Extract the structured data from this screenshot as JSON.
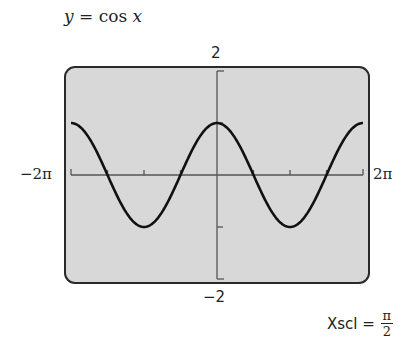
{
  "title": {
    "lhs": "y",
    "eq": " = cos ",
    "var": "x"
  },
  "labels": {
    "y_max": "2",
    "y_min": "−2",
    "x_min": "−2π",
    "x_max": "2π"
  },
  "xscl": {
    "label": "Xscl =",
    "numerator": "π",
    "denominator": "2"
  },
  "colors": {
    "frame_fill": "#d8d8d8",
    "frame_border": "#2a2a2a",
    "curve": "#111111",
    "axis": "#555555"
  },
  "chart_data": {
    "type": "line",
    "title": "y = cos x",
    "function": "cos(x)",
    "xlabel": "",
    "ylabel": "",
    "xlim": [
      "-2π",
      "2π"
    ],
    "xlim_numeric": [
      -6.2832,
      6.2832
    ],
    "ylim": [
      -2,
      2
    ],
    "xscl": "π/2",
    "yscl": 1,
    "grid": false,
    "x_tick_labels": [
      "-2π",
      "2π"
    ],
    "y_tick_labels": [
      "-2",
      "2"
    ],
    "series": [
      {
        "name": "cos x",
        "x": [
          -6.2832,
          -4.7124,
          -3.1416,
          -1.5708,
          0,
          1.5708,
          3.1416,
          4.7124,
          6.2832
        ],
        "values": [
          1,
          0,
          -1,
          0,
          1,
          0,
          -1,
          0,
          1
        ]
      }
    ]
  }
}
